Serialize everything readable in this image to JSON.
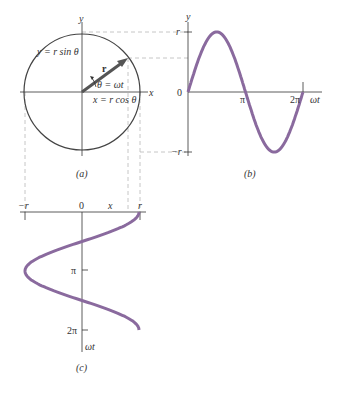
{
  "panel_a": {
    "caption": "(a)",
    "y_axis_label": "y",
    "x_axis_label": "x",
    "vector_label": "r",
    "y_eq": "y = r sin θ",
    "theta_eq": "θ = ωt",
    "x_eq": "x = r cos θ"
  },
  "panel_b": {
    "caption": "(b)",
    "y_axis_label": "y",
    "x_axis_label": "ωt",
    "y_top": "r",
    "y_bottom": "−r",
    "origin": "0",
    "tick_pi": "π",
    "tick_2pi": "2π"
  },
  "panel_c": {
    "caption": "(c)",
    "x_left": "−r",
    "x_zero": "0",
    "x_label": "x",
    "x_right": "r",
    "tick_pi": "π",
    "tick_2pi": "2π",
    "t_axis_label": "ωt"
  },
  "colors": {
    "curve": "#8a6a9e",
    "axis": "#333333",
    "dashed": "#b0b0b0",
    "vector": "#555555"
  },
  "chart_data": [
    {
      "type": "line",
      "title": "(b) y = r sin(ωt)",
      "xlabel": "ωt",
      "ylabel": "y",
      "x_ticks": [
        "0",
        "π",
        "2π"
      ],
      "y_ticks": [
        "−r",
        "0",
        "r"
      ],
      "x": [
        0,
        0.7854,
        1.5708,
        2.3562,
        3.1416,
        3.927,
        4.7124,
        5.4978,
        6.2832
      ],
      "series": [
        {
          "name": "y = r sin ωt",
          "values": [
            0,
            0.707,
            1,
            0.707,
            0,
            -0.707,
            -1,
            -0.707,
            0
          ]
        }
      ]
    },
    {
      "type": "line",
      "title": "(c) x = r cos(ωt)",
      "xlabel": "x",
      "ylabel": "ωt",
      "x_ticks": [
        "−r",
        "0",
        "r"
      ],
      "y_ticks": [
        "π",
        "2π"
      ],
      "x": [
        0,
        0.7854,
        1.5708,
        2.3562,
        3.1416,
        3.927,
        4.7124,
        5.4978,
        6.2832
      ],
      "series": [
        {
          "name": "x = r cos ωt",
          "values": [
            1,
            0.707,
            0,
            -0.707,
            -1,
            -0.707,
            0,
            0.707,
            1
          ]
        }
      ]
    }
  ]
}
